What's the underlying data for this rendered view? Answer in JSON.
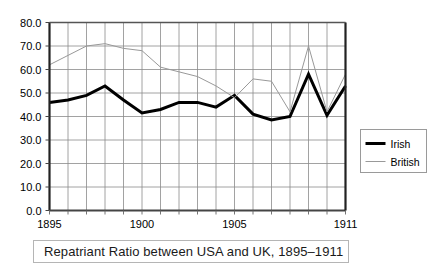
{
  "caption": {
    "text": "Repatriant Ratio between USA and UK, 1895–1911"
  },
  "legend": {
    "position": "right-middle",
    "entries": [
      {
        "label": "Irish",
        "color": "#000000",
        "style": "thick-solid"
      },
      {
        "label": "British",
        "color": "#999999",
        "style": "thin-solid"
      }
    ]
  },
  "axes": {
    "y_ticks": [
      "0.0",
      "10.0",
      "20.0",
      "30.0",
      "40.0",
      "50.0",
      "60.0",
      "70.0",
      "80.0"
    ],
    "x_ticks": [
      "1895",
      "1900",
      "1905",
      "1911"
    ]
  },
  "chart_data": {
    "type": "line",
    "title": "Repatriant Ratio between USA and UK, 1895–1911",
    "xlabel": "",
    "ylabel": "",
    "ylim": [
      0,
      80
    ],
    "ytick_step": 10,
    "xlim": [
      1895,
      1911
    ],
    "grid": true,
    "legend_position": "right-middle",
    "x": [
      1895,
      1896,
      1897,
      1898,
      1899,
      1900,
      1901,
      1902,
      1903,
      1904,
      1905,
      1906,
      1907,
      1908,
      1909,
      1910,
      1911
    ],
    "categories": [
      "1895",
      "1896",
      "1897",
      "1898",
      "1899",
      "1900",
      "1901",
      "1902",
      "1903",
      "1904",
      "1905",
      "1906",
      "1907",
      "1908",
      "1909",
      "1910",
      "1911"
    ],
    "x_tick_labels": [
      "1895",
      "1900",
      "1905",
      "1911"
    ],
    "x_tick_values": [
      1895,
      1900,
      1905,
      1911
    ],
    "series": [
      {
        "name": "Irish",
        "color": "#000000",
        "width": 3,
        "values": [
          46.0,
          47.0,
          49.0,
          53.0,
          47.0,
          41.5,
          43.0,
          46.0,
          46.0,
          44.0,
          49.0,
          41.0,
          38.5,
          40.0,
          58.0,
          40.5,
          53.0
        ]
      },
      {
        "name": "British",
        "color": "#999999",
        "width": 1,
        "values": [
          62.0,
          66.0,
          70.0,
          71.0,
          69.0,
          68.0,
          61.0,
          59.0,
          57.0,
          53.0,
          48.0,
          56.0,
          55.0,
          42.0,
          70.0,
          42.0,
          58.0
        ]
      }
    ]
  }
}
